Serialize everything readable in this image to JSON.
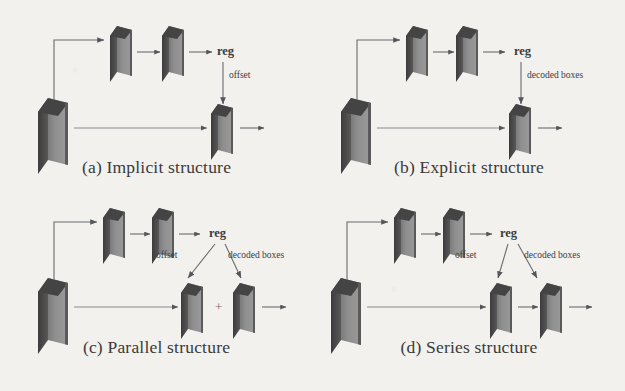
{
  "figure": {
    "type": "diagram",
    "background_color": "#f2f1ee",
    "ink_color": "#3d3d3d",
    "slab_front_color": "#8e8e8e",
    "slab_side_color": "#4e4e4e",
    "slab_top_color": "#3f3f3f"
  },
  "panels": [
    {
      "id": "a",
      "caption": "(a) Implicit structure",
      "labels": {
        "reg": "reg",
        "branch": "offset"
      },
      "slabs": [
        {
          "name": "backbone-feature-slab",
          "role": "input"
        },
        {
          "name": "branch-slab-1",
          "role": "conv"
        },
        {
          "name": "branch-slab-2",
          "role": "conv"
        },
        {
          "name": "output-slab",
          "role": "output"
        }
      ]
    },
    {
      "id": "b",
      "caption": "(b) Explicit structure",
      "labels": {
        "reg": "reg",
        "branch": "decoded boxes"
      },
      "slabs": [
        {
          "name": "backbone-feature-slab",
          "role": "input"
        },
        {
          "name": "branch-slab-1",
          "role": "conv"
        },
        {
          "name": "branch-slab-2",
          "role": "conv"
        },
        {
          "name": "output-slab",
          "role": "output"
        }
      ]
    },
    {
      "id": "c",
      "caption": "(c) Parallel structure",
      "labels": {
        "reg": "reg",
        "branch_left": "offset",
        "branch_right": "decoded boxes",
        "combine": "+"
      },
      "slabs": [
        {
          "name": "backbone-feature-slab",
          "role": "input"
        },
        {
          "name": "branch-slab-1",
          "role": "conv"
        },
        {
          "name": "branch-slab-2",
          "role": "conv"
        },
        {
          "name": "output-slab-offset",
          "role": "output"
        },
        {
          "name": "output-slab-decoded",
          "role": "output"
        }
      ]
    },
    {
      "id": "d",
      "caption": "(d) Series structure",
      "labels": {
        "reg": "reg",
        "branch_left": "offset",
        "branch_right": "decoded boxes"
      },
      "slabs": [
        {
          "name": "backbone-feature-slab",
          "role": "input"
        },
        {
          "name": "branch-slab-1",
          "role": "conv"
        },
        {
          "name": "branch-slab-2",
          "role": "conv"
        },
        {
          "name": "output-slab-offset",
          "role": "output"
        },
        {
          "name": "output-slab-decoded",
          "role": "output"
        }
      ]
    }
  ]
}
